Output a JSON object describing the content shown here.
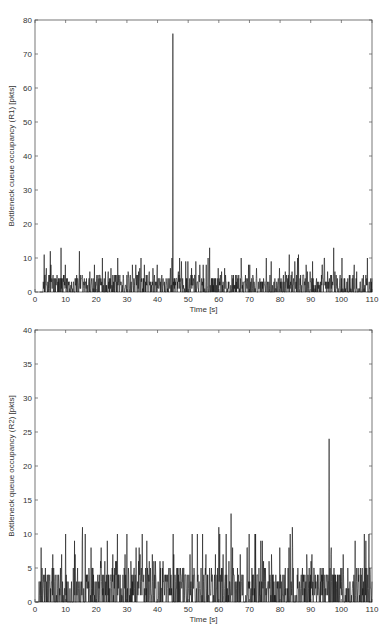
{
  "chart_data": [
    {
      "type": "line",
      "title": "",
      "xlabel": "Time [s]",
      "ylabel": "Bottleneck cueue occupancy (R1) [pkts]",
      "xlim": [
        0,
        110
      ],
      "ylim": [
        0,
        80
      ],
      "xticks": [
        0,
        10,
        20,
        30,
        40,
        50,
        60,
        70,
        80,
        90,
        100,
        110
      ],
      "yticks": [
        0,
        10,
        20,
        30,
        40,
        50,
        60,
        70,
        80
      ],
      "grid": false,
      "legend": null,
      "series": [
        {
          "name": "R1 queue occupancy",
          "color": "#111111",
          "description": "Noisy queue occupancy mostly between 0 and 10 packets from ~2 s to 110 s, with one large spike at ~45 s.",
          "baseline_range": [
            0,
            10
          ],
          "notable_points": [
            {
              "x": 3,
              "y": 11
            },
            {
              "x": 5,
              "y": 12
            },
            {
              "x": 8.5,
              "y": 13
            },
            {
              "x": 14.5,
              "y": 12
            },
            {
              "x": 22,
              "y": 10
            },
            {
              "x": 27,
              "y": 10
            },
            {
              "x": 45,
              "y": 76
            },
            {
              "x": 57,
              "y": 13
            },
            {
              "x": 83,
              "y": 11
            },
            {
              "x": 86,
              "y": 11
            },
            {
              "x": 97.5,
              "y": 13
            },
            {
              "x": 108.5,
              "y": 10
            }
          ]
        }
      ]
    },
    {
      "type": "line",
      "title": "",
      "xlabel": "Time [s]",
      "ylabel": "Bottleneck queue occupancy (R2) [pkts]",
      "xlim": [
        0,
        110
      ],
      "ylim": [
        0,
        40
      ],
      "xticks": [
        0,
        10,
        20,
        30,
        40,
        50,
        60,
        70,
        80,
        90,
        100,
        110
      ],
      "yticks": [
        0,
        5,
        10,
        15,
        20,
        25,
        30,
        35,
        40
      ],
      "grid": false,
      "legend": null,
      "series": [
        {
          "name": "R2 queue occupancy",
          "color": "#111111",
          "description": "Noisy queue occupancy mostly between 0 and 10 packets from ~1 s to 110 s, with spikes at ~64 s and ~96 s.",
          "baseline_range": [
            0,
            10
          ],
          "notable_points": [
            {
              "x": 2,
              "y": 8
            },
            {
              "x": 10,
              "y": 10
            },
            {
              "x": 15.5,
              "y": 11
            },
            {
              "x": 30,
              "y": 10
            },
            {
              "x": 53,
              "y": 10
            },
            {
              "x": 60,
              "y": 11
            },
            {
              "x": 64,
              "y": 13
            },
            {
              "x": 72,
              "y": 10
            },
            {
              "x": 84,
              "y": 11
            },
            {
              "x": 96,
              "y": 24
            },
            {
              "x": 108,
              "y": 9
            }
          ]
        }
      ]
    }
  ]
}
